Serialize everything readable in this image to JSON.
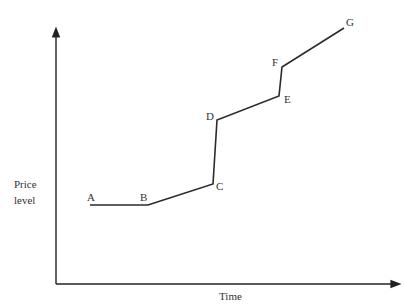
{
  "chart_data": {
    "type": "line",
    "title": "",
    "xlabel": "Time",
    "ylabel": "Price level",
    "ylabel_lines": [
      "Price",
      "level"
    ],
    "grid": false,
    "legend": null,
    "axis_ticks": "none",
    "points": [
      {
        "label": "A",
        "x": 90,
        "y": 205
      },
      {
        "label": "B",
        "x": 148,
        "y": 205
      },
      {
        "label": "C",
        "x": 213,
        "y": 184
      },
      {
        "label": "D",
        "x": 217,
        "y": 120
      },
      {
        "label": "E",
        "x": 279,
        "y": 96
      },
      {
        "label": "F",
        "x": 282,
        "y": 67
      },
      {
        "label": "G",
        "x": 344,
        "y": 28
      }
    ],
    "segments": [
      {
        "from": "A",
        "to": "B",
        "description": "flat"
      },
      {
        "from": "B",
        "to": "C",
        "description": "gradual rise"
      },
      {
        "from": "C",
        "to": "D",
        "description": "sharp jump"
      },
      {
        "from": "D",
        "to": "E",
        "description": "gradual rise"
      },
      {
        "from": "E",
        "to": "F",
        "description": "sharp jump"
      },
      {
        "from": "F",
        "to": "G",
        "description": "gradual rise"
      }
    ]
  },
  "labels": {
    "A": "A",
    "B": "B",
    "C": "C",
    "D": "D",
    "E": "E",
    "F": "F",
    "G": "G",
    "y_line1": "Price",
    "y_line2": "level",
    "x": "Time"
  },
  "colors": {
    "line": "#2a2a2a",
    "axis": "#222222",
    "text": "#333333"
  }
}
